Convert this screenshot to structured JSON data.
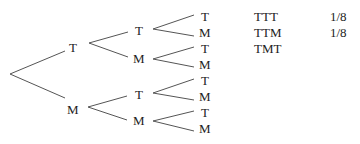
{
  "tree": {
    "level1": [
      {
        "label": "T"
      },
      {
        "label": "M"
      }
    ],
    "level2": [
      {
        "label": "T"
      },
      {
        "label": "M"
      },
      {
        "label": "T"
      },
      {
        "label": "M"
      }
    ],
    "level3": [
      {
        "label": "T"
      },
      {
        "label": "M"
      },
      {
        "label": "T"
      },
      {
        "label": "M"
      },
      {
        "label": "T"
      },
      {
        "label": "M"
      },
      {
        "label": "T"
      },
      {
        "label": "M"
      }
    ]
  },
  "outcomes": [
    {
      "outcome": "TTT",
      "probability": "1/8"
    },
    {
      "outcome": "TTM",
      "probability": "1/8"
    },
    {
      "outcome": "TMT",
      "probability": ""
    }
  ]
}
